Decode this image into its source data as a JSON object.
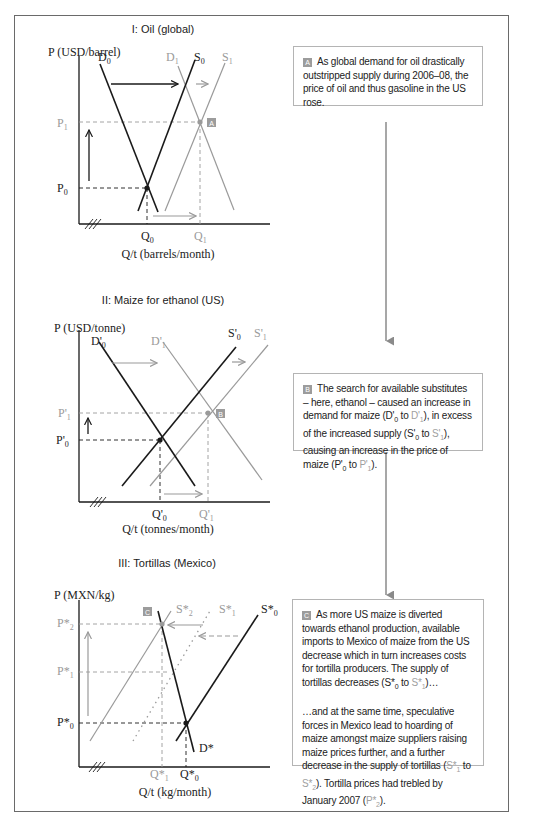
{
  "figure": {
    "panels": [
      {
        "id": "I",
        "title": "I: Oil (global)",
        "y_axis_label": "P (USD/barrel)",
        "x_axis_label": "Q/t (barrels/month)",
        "curves": {
          "D0": "D",
          "D1": "D",
          "S0": "S",
          "S1": "S"
        },
        "curve_labels": {
          "D0_base": "D",
          "D0_sub": "0",
          "D1_base": "D",
          "D1_sub": "1",
          "S0_base": "S",
          "S0_sub": "0",
          "S1_base": "S",
          "S1_sub": "1"
        },
        "price_ticks": {
          "P1_base": "P",
          "P1_sub": "1",
          "P0_base": "P",
          "P0_sub": "0"
        },
        "quantity_ticks": {
          "Q0_base": "Q",
          "Q0_sub": "0",
          "Q1_base": "Q",
          "Q1_sub": "1"
        },
        "marker": "A"
      },
      {
        "id": "II",
        "title": "II: Maize for ethanol (US)",
        "y_axis_label": "P (USD/tonne)",
        "x_axis_label": "Q/t (tonnes/month)",
        "curve_labels": {
          "D0_base": "D'",
          "D0_sub": "0",
          "D1_base": "D'",
          "D1_sub": "1",
          "S0_base": "S'",
          "S0_sub": "0",
          "S1_base": "S'",
          "S1_sub": "1"
        },
        "price_ticks": {
          "P1_base": "P'",
          "P1_sub": "1",
          "P0_base": "P'",
          "P0_sub": "0"
        },
        "quantity_ticks": {
          "Q0_base": "Q'",
          "Q0_sub": "0",
          "Q1_base": "Q'",
          "Q1_sub": "1"
        },
        "marker": "B"
      },
      {
        "id": "III",
        "title": "III: Tortillas (Mexico)",
        "y_axis_label": "P (MXN/kg)",
        "x_axis_label": "Q/t (kg/month)",
        "curve_labels": {
          "D_base": "D*",
          "S0_base": "S*",
          "S0_sub": "0",
          "S1_base": "S*",
          "S1_sub": "1",
          "S2_base": "S*",
          "S2_sub": "2"
        },
        "price_ticks": {
          "P2_base": "P*",
          "P2_sub": "2",
          "P1_base": "P*",
          "P1_sub": "1",
          "P0_base": "P*",
          "P0_sub": "0"
        },
        "quantity_ticks": {
          "Q1_base": "Q*",
          "Q1_sub": "1",
          "Q0_base": "Q*",
          "Q0_sub": "0"
        },
        "marker": "C"
      }
    ],
    "notes": {
      "A": {
        "badge": "A",
        "text": "As global demand for oil drastically outstripped supply during 2006–08, the price of oil and thus gasoline in the US rose."
      },
      "B": {
        "badge": "B",
        "t1": "The search for available substitutes – here, ethanol – caused an increase in demand for maize (D'",
        "t1_sub": "0",
        "t2": " to ",
        "t2_gray": "D'",
        "t2_gray_sub": "1",
        "t3": "), in excess of the increased supply (S'",
        "t3_sub": "0",
        "t4": " to ",
        "t4_gray": "S'",
        "t4_gray_sub": "1",
        "t5": "), causing an increase in the price of maize (P'",
        "t5_sub": "0",
        "t6": " to ",
        "t6_gray": "P'",
        "t6_gray_sub": "1",
        "t7": ")."
      },
      "C": {
        "badge": "C",
        "p1_a": "As more US maize is diverted towards ethanol production, available imports to Mexico of maize from the US decrease which in turn increases costs for tortilla producers. The supply of tortillas decreases (S*",
        "p1_a_sub": "0",
        "p1_b": " to ",
        "p1_b_gray": "S*",
        "p1_b_gray_sub": "1",
        "p1_c": ")…",
        "p2_a": "…and at the same time, speculative forces in Mexico lead to hoarding of maize amongst maize suppliers raising maize prices further, and a further decrease in the supply of tortillas (",
        "p2_a_gray": "S*",
        "p2_a_gray_sub": "1",
        "p2_b": " to ",
        "p2_b_gray": "S*",
        "p2_b_gray_sub": "2",
        "p2_c": "). Tortilla prices had trebled by January 2007 (",
        "p2_c_gray": "P*",
        "p2_c_gray_sub": "2",
        "p2_d": ")."
      }
    },
    "colors": {
      "dark_line": "#1a1a1a",
      "gray_line": "#9a9a9a",
      "badge": "#9c9c9c",
      "frame": "#6a6a6a",
      "note_border": "#b4b4b4"
    }
  }
}
